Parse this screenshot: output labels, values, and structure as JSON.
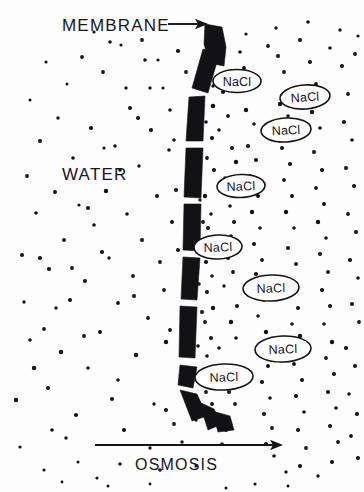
{
  "figure": {
    "title_label": "MEMBRANE",
    "region_label": "WATER",
    "process_label": "OSMOSIS",
    "solute_label": "NaCl",
    "ink_color": "#121216",
    "background_color": "#fdfdfd"
  },
  "labels": {
    "membrane": {
      "text": "MEMBRANE",
      "x": 62,
      "y": 31,
      "font_size": 17
    },
    "water": {
      "text": "WATER",
      "x": 62,
      "y": 180,
      "font_size": 17
    },
    "osmosis": {
      "text": "OSMOSIS",
      "x": 135,
      "y": 470,
      "font_size": 16
    }
  },
  "arrows": {
    "membrane_pointer": {
      "x1": 168,
      "y1": 24,
      "x2": 208,
      "y2": 24,
      "head": "right"
    },
    "osmosis_flow": {
      "x1": 95,
      "y1": 445,
      "x2": 283,
      "y2": 445,
      "head": "right"
    }
  },
  "chart_data": {
    "type": "diagram",
    "annotations": [
      "MEMBRANE",
      "WATER",
      "OSMOSIS"
    ],
    "solute_particles": {
      "label": "NaCl",
      "count": 8,
      "side": "right",
      "positions": [
        {
          "cx": 237,
          "cy": 81,
          "rx": 24,
          "ry": 11.5,
          "rotate": 0
        },
        {
          "cx": 305,
          "cy": 97,
          "rx": 25,
          "ry": 12,
          "rotate": -4
        },
        {
          "cx": 286,
          "cy": 130,
          "rx": 25,
          "ry": 12,
          "rotate": -3
        },
        {
          "cx": 241,
          "cy": 186,
          "rx": 24,
          "ry": 11.5,
          "rotate": -2
        },
        {
          "cx": 218,
          "cy": 247,
          "rx": 24,
          "ry": 12,
          "rotate": -2
        },
        {
          "cx": 271,
          "cy": 288,
          "rx": 28,
          "ry": 13,
          "rotate": -2
        },
        {
          "cx": 283,
          "cy": 349,
          "rx": 28,
          "ry": 13,
          "rotate": -2
        },
        {
          "cx": 224,
          "cy": 377,
          "rx": 29,
          "ry": 13,
          "rotate": -2
        }
      ]
    },
    "water_molecules": {
      "label": "water dot",
      "count": 240,
      "note": "small black dots filling both sides, denser right of membrane"
    },
    "membrane": {
      "orientation": "vertical S-curve",
      "segment_count": 11,
      "description": "broken dark band from top-right curving down and back right at bottom"
    }
  },
  "membrane_segments": [
    {
      "d": "M 205 24 L 222 27 L 226 47 L 224 66 L 209 63 L 204 44 Z"
    },
    {
      "d": "M 203 49 L 219 55 L 208 93 L 192 88 Z"
    },
    {
      "d": "M 189 97 L 205 96 L 203 141 L 186 141 Z"
    },
    {
      "d": "M 186 148 L 203 148 L 201 198 L 184 197 Z"
    },
    {
      "d": "M 184 204 L 201 204 L 200 251 L 183 250 Z"
    },
    {
      "d": "M 183 257 L 200 258 L 197 300 L 181 299 Z"
    },
    {
      "d": "M 180 306 L 197 307 L 195 358 L 179 357 Z"
    },
    {
      "d": "M 180 365 L 197 367 L 193 388 L 178 385 Z"
    },
    {
      "d": "M 180 390 L 197 394 L 207 416 L 192 421 Z"
    },
    {
      "d": "M 199 402 L 214 409 L 222 424 L 208 430 Z"
    },
    {
      "d": "M 212 411 L 230 416 L 234 430 L 218 432 Z"
    }
  ],
  "water_dots": [
    [
      16,
      400,
      2.2
    ],
    [
      20,
      447,
      1.6
    ],
    [
      22,
      255,
      2.0
    ],
    [
      24,
      302,
      1.7
    ],
    [
      27,
      176,
      1.9
    ],
    [
      30,
      100,
      1.5
    ],
    [
      34,
      368,
      2.2
    ],
    [
      36,
      213,
      1.8
    ],
    [
      40,
      141,
      2.0
    ],
    [
      44,
      329,
      1.9
    ],
    [
      46,
      62,
      1.6
    ],
    [
      49,
      269,
      2.1
    ],
    [
      52,
      430,
      1.8
    ],
    [
      55,
      192,
      2.0
    ],
    [
      58,
      118,
      1.7
    ],
    [
      61,
      352,
      2.2
    ],
    [
      64,
      240,
      1.9
    ],
    [
      67,
      84,
      1.5
    ],
    [
      70,
      300,
      2.0
    ],
    [
      73,
      158,
      1.8
    ],
    [
      76,
      415,
      2.1
    ],
    [
      79,
      205,
      1.6
    ],
    [
      82,
      57,
      1.9
    ],
    [
      85,
      281,
      2.0
    ],
    [
      88,
      368,
      1.7
    ],
    [
      91,
      128,
      2.1
    ],
    [
      94,
      225,
      1.8
    ],
    [
      97,
      478,
      1.6
    ],
    [
      100,
      332,
      2.0
    ],
    [
      103,
      72,
      1.9
    ],
    [
      106,
      191,
      2.2
    ],
    [
      109,
      258,
      1.7
    ],
    [
      112,
      399,
      2.0
    ],
    [
      115,
      146,
      1.8
    ],
    [
      118,
      303,
      1.9
    ],
    [
      121,
      45,
      1.6
    ],
    [
      124,
      430,
      2.1
    ],
    [
      127,
      214,
      1.8
    ],
    [
      130,
      108,
      2.0
    ],
    [
      133,
      276,
      1.9
    ],
    [
      136,
      355,
      2.2
    ],
    [
      139,
      166,
      1.7
    ],
    [
      142,
      240,
      2.0
    ],
    [
      145,
      60,
      1.8
    ],
    [
      148,
      318,
      1.9
    ],
    [
      151,
      130,
      2.1
    ],
    [
      154,
      404,
      1.7
    ],
    [
      157,
      196,
      2.0
    ],
    [
      160,
      262,
      1.9
    ],
    [
      163,
      88,
      1.6
    ],
    [
      166,
      342,
      2.2
    ],
    [
      169,
      150,
      1.8
    ],
    [
      172,
      222,
      2.0
    ],
    [
      174,
      424,
      1.9
    ],
    [
      150,
      88,
      1.7
    ],
    [
      138,
      118,
      2.0
    ],
    [
      120,
      170,
      1.8
    ],
    [
      104,
      148,
      1.6
    ],
    [
      88,
      208,
      2.0
    ],
    [
      72,
      268,
      1.9
    ],
    [
      56,
      308,
      1.7
    ],
    [
      40,
      258,
      2.1
    ],
    [
      30,
      340,
      1.8
    ],
    [
      48,
      388,
      2.0
    ],
    [
      66,
      438,
      1.7
    ],
    [
      84,
      336,
      1.9
    ],
    [
      102,
      252,
      2.1
    ],
    [
      118,
      380,
      1.8
    ],
    [
      134,
      296,
      2.0
    ],
    [
      150,
      448,
      1.7
    ],
    [
      164,
      290,
      1.9
    ],
    [
      176,
      190,
      2.0
    ],
    [
      170,
      110,
      1.8
    ],
    [
      158,
      60,
      1.6
    ],
    [
      142,
      40,
      1.9
    ],
    [
      126,
      88,
      1.7
    ],
    [
      110,
      42,
      1.8
    ],
    [
      94,
      32,
      1.6
    ],
    [
      178,
      51,
      2.1
    ],
    [
      186,
      72,
      1.9
    ],
    [
      174,
      140,
      1.8
    ],
    [
      178,
      250,
      2.0
    ],
    [
      170,
      330,
      1.9
    ],
    [
      166,
      410,
      2.0
    ],
    [
      182,
      442,
      1.7
    ],
    [
      160,
      470,
      1.8
    ],
    [
      196,
      466,
      1.6
    ],
    [
      120,
      464,
      1.7
    ],
    [
      78,
      462,
      1.5
    ],
    [
      44,
      470,
      1.6
    ],
    [
      208,
      78,
      2.0
    ],
    [
      213,
      106,
      2.3
    ],
    [
      206,
      122,
      1.8
    ],
    [
      212,
      138,
      2.1
    ],
    [
      207,
      158,
      1.9
    ],
    [
      214,
      170,
      2.0
    ],
    [
      205,
      196,
      2.2
    ],
    [
      211,
      214,
      1.8
    ],
    [
      208,
      228,
      2.0
    ],
    [
      214,
      243,
      1.9
    ],
    [
      206,
      262,
      2.1
    ],
    [
      212,
      276,
      1.8
    ],
    [
      207,
      292,
      2.0
    ],
    [
      213,
      308,
      2.2
    ],
    [
      205,
      322,
      1.9
    ],
    [
      211,
      338,
      2.0
    ],
    [
      207,
      356,
      1.8
    ],
    [
      214,
      371,
      2.1
    ],
    [
      206,
      392,
      1.9
    ],
    [
      212,
      404,
      2.0
    ],
    [
      219,
      59,
      1.8
    ],
    [
      223,
      92,
      2.1
    ],
    [
      228,
      116,
      1.9
    ],
    [
      232,
      148,
      2.0
    ],
    [
      236,
      162,
      2.2
    ],
    [
      230,
      206,
      1.8
    ],
    [
      234,
      222,
      2.0
    ],
    [
      228,
      258,
      2.1
    ],
    [
      233,
      272,
      1.9
    ],
    [
      237,
      306,
      2.0
    ],
    [
      231,
      322,
      2.2
    ],
    [
      236,
      338,
      1.8
    ],
    [
      229,
      392,
      2.0
    ],
    [
      235,
      404,
      1.9
    ],
    [
      226,
      430,
      2.1
    ],
    [
      222,
      444,
      1.8
    ],
    [
      244,
      68,
      2.0
    ],
    [
      250,
      88,
      1.9
    ],
    [
      246,
      110,
      2.2
    ],
    [
      254,
      124,
      1.8
    ],
    [
      248,
      146,
      2.0
    ],
    [
      256,
      160,
      2.1
    ],
    [
      250,
      176,
      1.9
    ],
    [
      258,
      196,
      2.0
    ],
    [
      252,
      212,
      2.2
    ],
    [
      260,
      228,
      1.8
    ],
    [
      254,
      244,
      2.0
    ],
    [
      262,
      260,
      1.9
    ],
    [
      256,
      274,
      2.1
    ],
    [
      264,
      300,
      2.0
    ],
    [
      258,
      316,
      1.8
    ],
    [
      266,
      332,
      2.2
    ],
    [
      260,
      348,
      1.9
    ],
    [
      268,
      366,
      2.0
    ],
    [
      262,
      382,
      2.1
    ],
    [
      270,
      398,
      1.8
    ],
    [
      264,
      414,
      2.0
    ],
    [
      272,
      428,
      1.9
    ],
    [
      266,
      444,
      2.1
    ],
    [
      274,
      456,
      1.8
    ],
    [
      278,
      56,
      2.0
    ],
    [
      284,
      72,
      1.9
    ],
    [
      280,
      104,
      2.2
    ],
    [
      288,
      116,
      1.8
    ],
    [
      282,
      148,
      2.0
    ],
    [
      290,
      164,
      2.1
    ],
    [
      284,
      180,
      1.9
    ],
    [
      292,
      196,
      2.0
    ],
    [
      286,
      212,
      2.2
    ],
    [
      294,
      228,
      1.8
    ],
    [
      288,
      248,
      2.0
    ],
    [
      296,
      264,
      1.9
    ],
    [
      290,
      280,
      2.1
    ],
    [
      298,
      308,
      2.0
    ],
    [
      292,
      324,
      1.8
    ],
    [
      300,
      336,
      2.2
    ],
    [
      294,
      364,
      1.9
    ],
    [
      302,
      380,
      2.0
    ],
    [
      296,
      396,
      2.1
    ],
    [
      304,
      412,
      1.8
    ],
    [
      298,
      430,
      2.0
    ],
    [
      306,
      448,
      1.9
    ],
    [
      300,
      466,
      2.1
    ],
    [
      286,
      472,
      1.7
    ],
    [
      310,
      62,
      2.0
    ],
    [
      316,
      84,
      1.9
    ],
    [
      312,
      112,
      2.2
    ],
    [
      320,
      128,
      1.8
    ],
    [
      314,
      152,
      2.0
    ],
    [
      322,
      170,
      2.1
    ],
    [
      316,
      188,
      1.9
    ],
    [
      324,
      204,
      2.0
    ],
    [
      318,
      222,
      2.2
    ],
    [
      326,
      238,
      1.8
    ],
    [
      320,
      254,
      2.0
    ],
    [
      328,
      272,
      1.9
    ],
    [
      322,
      290,
      2.1
    ],
    [
      330,
      306,
      2.0
    ],
    [
      324,
      324,
      1.8
    ],
    [
      332,
      342,
      2.2
    ],
    [
      326,
      358,
      1.9
    ],
    [
      334,
      374,
      2.0
    ],
    [
      328,
      392,
      2.1
    ],
    [
      336,
      408,
      1.8
    ],
    [
      330,
      426,
      2.0
    ],
    [
      338,
      442,
      1.9
    ],
    [
      332,
      462,
      2.1
    ],
    [
      318,
      476,
      1.7
    ],
    [
      342,
      66,
      2.0
    ],
    [
      348,
      94,
      1.9
    ],
    [
      344,
      122,
      2.1
    ],
    [
      352,
      140,
      1.8
    ],
    [
      346,
      168,
      2.0
    ],
    [
      354,
      186,
      2.0
    ],
    [
      348,
      214,
      1.9
    ],
    [
      356,
      232,
      2.0
    ],
    [
      350,
      260,
      2.1
    ],
    [
      358,
      278,
      1.8
    ],
    [
      352,
      304,
      2.0
    ],
    [
      359,
      322,
      1.9
    ],
    [
      346,
      348,
      2.1
    ],
    [
      355,
      366,
      2.0
    ],
    [
      349,
      394,
      1.8
    ],
    [
      357,
      414,
      2.1
    ],
    [
      351,
      436,
      1.9
    ],
    [
      358,
      458,
      2.0
    ],
    [
      240,
      52,
      1.8
    ],
    [
      268,
      46,
      1.9
    ],
    [
      300,
      40,
      2.0
    ],
    [
      330,
      48,
      1.8
    ],
    [
      355,
      54,
      1.9
    ],
    [
      218,
      44,
      1.7
    ],
    [
      246,
      34,
      1.6
    ],
    [
      276,
      28,
      1.7
    ],
    [
      308,
      22,
      1.8
    ],
    [
      340,
      30,
      1.7
    ],
    [
      358,
      36,
      1.6
    ],
    [
      226,
      488,
      1.5
    ],
    [
      255,
      484,
      1.6
    ],
    [
      288,
      486,
      1.5
    ],
    [
      150,
      484,
      1.4
    ],
    [
      108,
      486,
      1.5
    ],
    [
      62,
      482,
      1.4
    ],
    [
      200,
      200,
      1.7
    ],
    [
      203,
      222,
      1.9
    ],
    [
      199,
      284,
      1.8
    ],
    [
      202,
      312,
      2.0
    ],
    [
      198,
      346,
      1.8
    ],
    [
      204,
      380,
      1.9
    ],
    [
      196,
      420,
      1.7
    ],
    [
      213,
      86,
      1.7
    ],
    [
      219,
      130,
      1.8
    ],
    [
      225,
      178,
      1.7
    ],
    [
      231,
      236,
      1.8
    ],
    [
      224,
      286,
      1.7
    ],
    [
      219,
      348,
      1.8
    ]
  ]
}
